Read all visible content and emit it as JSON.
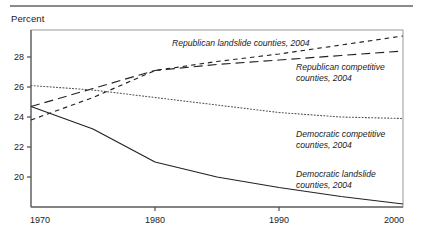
{
  "figure": {
    "axis_title": "Percent",
    "rule_color": "#8a8a8a"
  },
  "chart_data": {
    "type": "line",
    "title": "",
    "subtitle": "",
    "xlabel": "",
    "ylabel": "Percent",
    "xlim": [
      1970,
      2000
    ],
    "ylim": [
      18,
      29.8
    ],
    "xticks": [
      1970,
      1980,
      1990,
      2000
    ],
    "xtick_labels": [
      "1970",
      "1980",
      "1990",
      "2000"
    ],
    "yticks": [
      20,
      22,
      24,
      26,
      28
    ],
    "ytick_labels": [
      "20",
      "22",
      "24",
      "26",
      "28"
    ],
    "grid": false,
    "legend_position": "inline-annotations",
    "series": [
      {
        "name": "Republican landslide counties, 2004",
        "style": "short-dash",
        "color": "#222222",
        "x": [
          1970,
          1975,
          1980,
          1985,
          1990,
          1995,
          2000
        ],
        "values": [
          23.8,
          25.3,
          27.1,
          27.7,
          28.2,
          28.8,
          29.4
        ]
      },
      {
        "name": "Republican competitive counties, 2004",
        "style": "long-dash",
        "color": "#222222",
        "x": [
          1970,
          1975,
          1980,
          1985,
          1990,
          1995,
          2000
        ],
        "values": [
          24.7,
          25.9,
          27.1,
          27.5,
          27.8,
          28.1,
          28.4
        ]
      },
      {
        "name": "Democratic competitive counties, 2004",
        "style": "dotted",
        "color": "#555555",
        "x": [
          1970,
          1975,
          1980,
          1985,
          1990,
          1995,
          2000
        ],
        "values": [
          26.1,
          25.8,
          25.3,
          24.8,
          24.3,
          24.0,
          23.9
        ]
      },
      {
        "name": "Democratic landslide counties, 2004",
        "style": "solid",
        "color": "#222222",
        "x": [
          1970,
          1975,
          1980,
          1985,
          1990,
          1995,
          2000
        ],
        "values": [
          24.7,
          23.2,
          21.0,
          20.0,
          19.3,
          18.7,
          18.2
        ]
      }
    ],
    "annotations": [
      {
        "id": "republican-landslide",
        "lines": [
          "Republican landslide counties, 2004"
        ],
        "x": 172,
        "y": 46
      },
      {
        "id": "republican-competitive",
        "lines": [
          "Republican competitive",
          "counties, 2004"
        ],
        "x": 296,
        "y": 70
      },
      {
        "id": "democratic-competitive",
        "lines": [
          "Democratic competitive",
          "counties, 2004"
        ],
        "x": 296,
        "y": 137
      },
      {
        "id": "democratic-landslide",
        "lines": [
          "Democratic landslide",
          "counties, 2004"
        ],
        "x": 296,
        "y": 177
      }
    ]
  }
}
